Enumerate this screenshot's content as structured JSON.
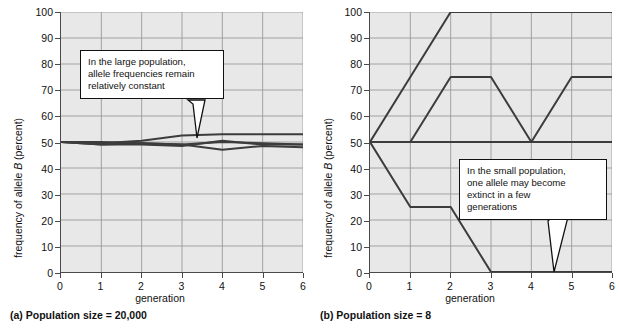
{
  "figure": {
    "y_axis_label_pre": "frequency of allele ",
    "y_axis_label_italic": "B",
    "y_axis_label_post": " (percent)",
    "x_axis_label": "generation",
    "y_ticks": [
      "0",
      "10",
      "20",
      "30",
      "40",
      "50",
      "60",
      "70",
      "80",
      "90",
      "100"
    ],
    "x_ticks": [
      "0",
      "1",
      "2",
      "3",
      "4",
      "5",
      "6"
    ],
    "plot_bg": "#e8e8e8",
    "grid_color": "#9a9a9a",
    "axis_color": "#4a4a4a",
    "line_color": "#3c3c3c"
  },
  "panels": [
    {
      "id": "panel-a",
      "caption": "(a) Population size = 20,000",
      "callout": {
        "lines": [
          "In the large population,",
          "allele frequencies remain",
          "relatively constant"
        ]
      }
    },
    {
      "id": "panel-b",
      "caption": "(b) Population size = 8",
      "callout": {
        "lines": [
          "In the small population,",
          "one allele may become",
          "extinct in a few",
          "generations"
        ]
      }
    }
  ],
  "chart_data": [
    {
      "type": "line",
      "title": "(a) Population size = 20,000",
      "xlabel": "generation",
      "ylabel": "frequency of allele B (percent)",
      "xlim": [
        0,
        6
      ],
      "ylim": [
        0,
        100
      ],
      "x": [
        0,
        1,
        2,
        3,
        4,
        5,
        6
      ],
      "grid": true,
      "legend": "none",
      "series": [
        {
          "name": "population 1",
          "values": [
            50,
            49.5,
            50.5,
            52.5,
            53,
            53,
            53
          ]
        },
        {
          "name": "population 2",
          "values": [
            50,
            49,
            49,
            48.5,
            50.5,
            49,
            49
          ]
        },
        {
          "name": "population 3",
          "values": [
            50,
            49,
            49.5,
            49,
            47,
            48.5,
            48
          ]
        },
        {
          "name": "population 4",
          "values": [
            50,
            50,
            49.5,
            49,
            50,
            49.5,
            49
          ]
        }
      ],
      "annotation": "In the large population, allele frequencies remain relatively constant"
    },
    {
      "type": "line",
      "title": "(b) Population size = 8",
      "xlabel": "generation",
      "ylabel": "frequency of allele B (percent)",
      "xlim": [
        0,
        6
      ],
      "ylim": [
        0,
        100
      ],
      "x": [
        0,
        1,
        2,
        3,
        4,
        5,
        6
      ],
      "grid": true,
      "legend": "none",
      "series": [
        {
          "name": "population 1 (fixed at 100)",
          "values": [
            50,
            75,
            100,
            100,
            100,
            100,
            100
          ]
        },
        {
          "name": "population 2",
          "values": [
            50,
            50,
            75,
            75,
            50,
            75,
            75
          ]
        },
        {
          "name": "population 3 (constant 50)",
          "values": [
            50,
            50,
            50,
            50,
            50,
            50,
            50
          ]
        },
        {
          "name": "population 4 (extinct at 0)",
          "values": [
            50,
            25,
            25,
            0,
            0,
            0,
            0
          ]
        }
      ],
      "annotation": "In the small population, one allele may become extinct in a few generations"
    }
  ]
}
